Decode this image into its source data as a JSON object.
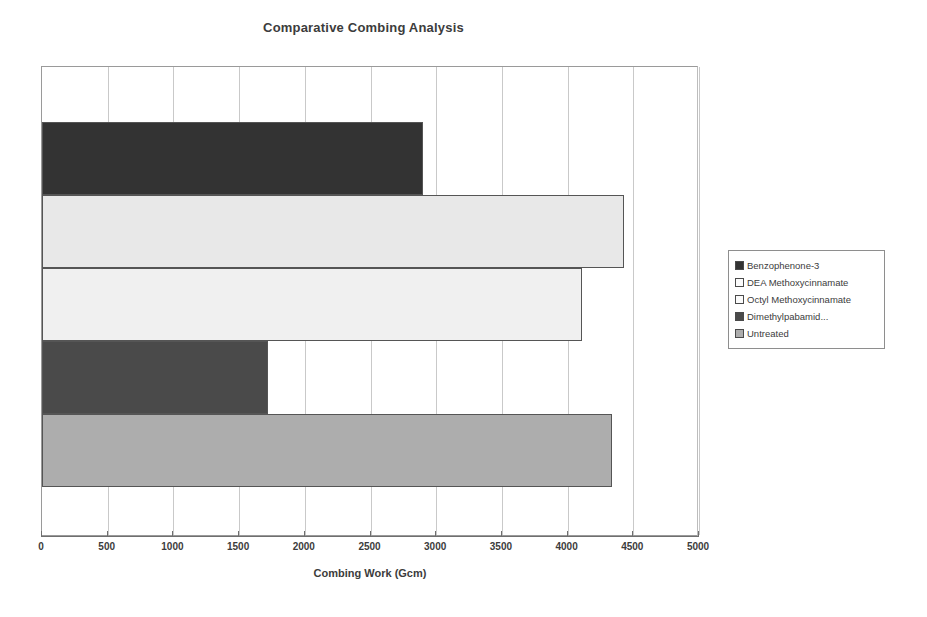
{
  "chart_data": {
    "type": "bar",
    "orientation": "horizontal",
    "title": "Comparative Combing Analysis",
    "xlabel": "Combing Work (Gcm)",
    "ylabel": "",
    "xlim": [
      0,
      5000
    ],
    "xticks": [
      0,
      500,
      1000,
      1500,
      2000,
      2500,
      3000,
      3500,
      4000,
      4500,
      5000
    ],
    "xtick_labels": [
      "0",
      "500",
      "1000",
      "1500",
      "2000",
      "2500",
      "3000",
      "3500",
      "4000",
      "4500",
      "5000"
    ],
    "grid": true,
    "grid_axis": "x",
    "legend_position": "right",
    "categories": [
      "Benzophenone-3",
      "DEA Methoxycinnamate",
      "Octyl Methoxycinnamate",
      "Dimethylpabamid...",
      "Untreated"
    ],
    "values": [
      2900,
      4430,
      4110,
      1720,
      4340
    ],
    "colors": [
      "#333333",
      "#e8e8e8",
      "#f0f0f0",
      "#4a4a4a",
      "#adadad"
    ],
    "bars": [
      {
        "label": "Benzophenone-3",
        "value": 2900,
        "color": "#333333"
      },
      {
        "label": "DEA Methoxycinnamate",
        "value": 4430,
        "color": "#e8e8e8"
      },
      {
        "label": "Octyl Methoxycinnamate",
        "value": 4110,
        "color": "#f0f0f0"
      },
      {
        "label": "Dimethylpabamid...",
        "value": 1720,
        "color": "#4a4a4a"
      },
      {
        "label": "Untreated",
        "value": 4340,
        "color": "#adadad"
      }
    ]
  },
  "legend": {
    "items": [
      {
        "label": "Benzophenone-3",
        "color": "#333333"
      },
      {
        "label": "DEA Methoxycinnamate",
        "color": "#fbfbfb"
      },
      {
        "label": "Octyl Methoxycinnamate",
        "color": "#fbfbfb"
      },
      {
        "label": "Dimethylpabamid...",
        "color": "#4a4a4a"
      },
      {
        "label": "Untreated",
        "color": "#adadad"
      }
    ]
  }
}
